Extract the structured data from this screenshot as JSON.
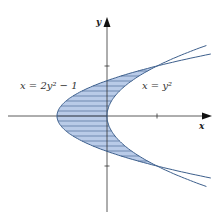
{
  "diagram": {
    "title": "",
    "axes": {
      "x_label": "x",
      "y_label": "y",
      "x_ticks": [
        1
      ],
      "y_ticks": [
        1,
        -1
      ]
    },
    "curves": [
      {
        "name": "left-parabola",
        "equation": "x = 2y² − 1",
        "label": "x = 2y² − 1"
      },
      {
        "name": "right-parabola",
        "equation": "x = y²",
        "label": "x = y²"
      }
    ],
    "region": {
      "description": "shaded region between x = 2y² − 1 and x = y² for −1 ≤ y ≤ 1",
      "style": "horizontal hatch"
    },
    "intersections": [
      [
        1,
        1
      ],
      [
        1,
        -1
      ]
    ],
    "colors": {
      "curve": "#3d5f8c",
      "fill": "#b9cbe8",
      "hatch": "#3d5f8c",
      "axis": "#333333"
    }
  }
}
